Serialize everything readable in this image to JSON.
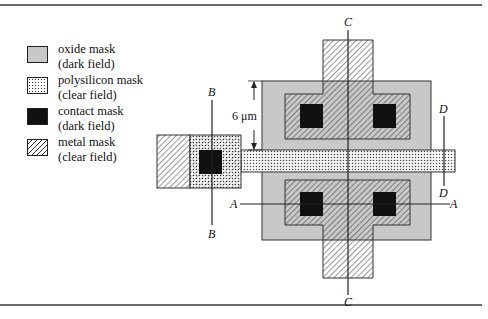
{
  "legend": {
    "items": [
      {
        "name": "oxide",
        "line1": "oxide mask",
        "line2": "(dark field)",
        "fill": "#c8c8c8"
      },
      {
        "name": "polysilicon",
        "line1": "polysilicon mask",
        "line2": "(clear field)",
        "fill": "dots"
      },
      {
        "name": "contact",
        "line1": "contact mask",
        "line2": "(dark field)",
        "fill": "#111111"
      },
      {
        "name": "metal",
        "line1": "metal mask",
        "line2": "(clear field)",
        "fill": "hatch"
      }
    ]
  },
  "diagram": {
    "dimension_label": "6 μm",
    "section_labels": {
      "A_left": "A",
      "A_right": "A",
      "B_top": "B",
      "B_bottom": "B",
      "C_top": "C",
      "C_bottom": "C",
      "D_top": "D",
      "D_bottom": "D"
    },
    "colors": {
      "oxide": "#c8c8c8",
      "contact": "#111111",
      "line": "#222222",
      "rule": "#6a6a6a"
    }
  }
}
